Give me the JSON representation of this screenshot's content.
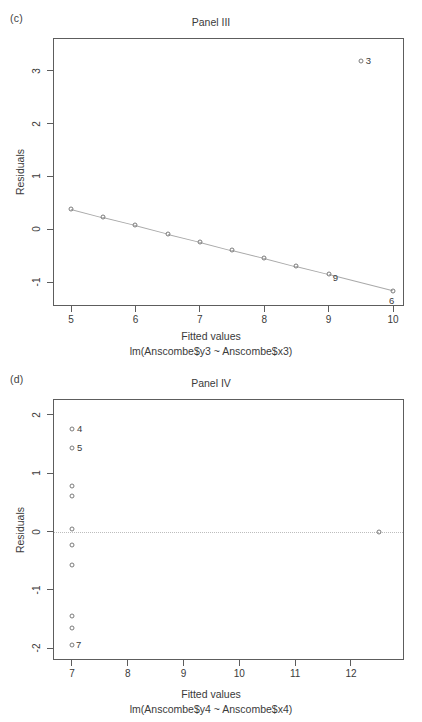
{
  "figure": {
    "background": "#ffffff",
    "point_color": "#7b7b7b",
    "axis_color": "#5d5d5d",
    "line_color": "#a9a9a9"
  },
  "panels": [
    {
      "tag": "(c)",
      "title": "Panel III",
      "xlabel": "Fitted values",
      "xsublabel": "lm(Anscombe$y3 ~ Anscombe$x3)",
      "ylabel": "Residuals",
      "xticks": [
        "5",
        "6",
        "7",
        "8",
        "9",
        "10"
      ],
      "yticks": [
        "3",
        "2",
        "1",
        "0",
        "-1"
      ]
    },
    {
      "tag": "(d)",
      "title": "Panel IV",
      "xlabel": "Fitted values",
      "xsublabel": "lm(Anscombe$y4 ~ Anscombe$x4)",
      "ylabel": "Residuals",
      "xticks": [
        "7",
        "8",
        "9",
        "10",
        "11",
        "12"
      ],
      "yticks": [
        "2",
        "1",
        "0",
        "-1",
        "-2"
      ]
    }
  ],
  "chart_data": [
    {
      "type": "scatter",
      "title": "Panel III",
      "panel_tag": "(c)",
      "xlabel": "Fitted values",
      "xsublabel": "lm(Anscombe$y3 ~ Anscombe$x3)",
      "ylabel": "Residuals",
      "xlim": [
        4.72,
        10.17
      ],
      "ylim": [
        -1.45,
        3.62
      ],
      "xticks": [
        5,
        6,
        7,
        8,
        9,
        10
      ],
      "yticks": [
        -1,
        0,
        1,
        2,
        3
      ],
      "grid": false,
      "legend": null,
      "smoother_line": true,
      "x": [
        5.0,
        5.5,
        6.0,
        6.5,
        7.0,
        7.5,
        8.0,
        8.5,
        9.0,
        9.5,
        10.0
      ],
      "y": [
        0.39,
        0.23,
        0.08,
        -0.08,
        -0.23,
        -0.39,
        -0.54,
        -0.7,
        -0.85,
        3.19,
        -1.16
      ],
      "point_labels": [
        {
          "label": "3",
          "x": 9.5,
          "y": 3.19
        },
        {
          "label": "9",
          "x": 9.0,
          "y": -0.85
        },
        {
          "label": "6",
          "x": 10.0,
          "y": -1.16
        }
      ]
    },
    {
      "type": "scatter",
      "title": "Panel IV",
      "panel_tag": "(d)",
      "xlabel": "Fitted values",
      "xsublabel": "lm(Anscombe$y4 ~ Anscombe$x4)",
      "ylabel": "Residuals",
      "xlim": [
        6.66,
        12.95
      ],
      "ylim": [
        -2.2,
        2.27
      ],
      "xticks": [
        7,
        8,
        9,
        10,
        11,
        12
      ],
      "yticks": [
        -2,
        -1,
        0,
        1,
        2
      ],
      "grid": false,
      "legend": null,
      "zero_reference_line": 0,
      "x": [
        7.0,
        7.0,
        7.0,
        7.0,
        7.0,
        7.0,
        7.0,
        7.0,
        7.0,
        7.0,
        12.5
      ],
      "y": [
        1.76,
        1.43,
        0.78,
        0.61,
        0.05,
        -0.23,
        -0.57,
        -1.45,
        -1.66,
        -1.95,
        0.0
      ],
      "point_labels": [
        {
          "label": "4",
          "x": 7.0,
          "y": 1.76
        },
        {
          "label": "5",
          "x": 7.0,
          "y": 1.43
        },
        {
          "label": "7",
          "x": 7.0,
          "y": -1.95
        }
      ]
    }
  ]
}
